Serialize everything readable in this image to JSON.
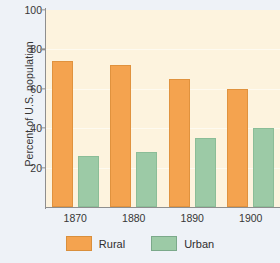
{
  "chart_data": {
    "type": "bar",
    "title": "",
    "xlabel": "",
    "ylabel": "Percent of U.S. population",
    "categories": [
      "1870",
      "1880",
      "1890",
      "1900"
    ],
    "series": [
      {
        "name": "Rural",
        "color": "#f4a34f",
        "values": [
          74,
          72,
          65,
          60
        ]
      },
      {
        "name": "Urban",
        "color": "#9ccaa6",
        "values": [
          26,
          28,
          35,
          40
        ]
      }
    ],
    "ylim": [
      0,
      100
    ],
    "yticks": [
      20,
      40,
      60,
      80,
      100
    ],
    "ytick_labels": [
      "20",
      "40",
      "60",
      "80",
      "100"
    ],
    "grid": true,
    "legend_position": "bottom",
    "plot_background": "#fdf3de",
    "figure_background": "#eef2f7",
    "axis_color": "#8e8e8e"
  },
  "legend": {
    "entries": [
      {
        "label": "Rural",
        "swatch": "rural-swatch"
      },
      {
        "label": "Urban",
        "swatch": "urban-swatch"
      }
    ]
  }
}
